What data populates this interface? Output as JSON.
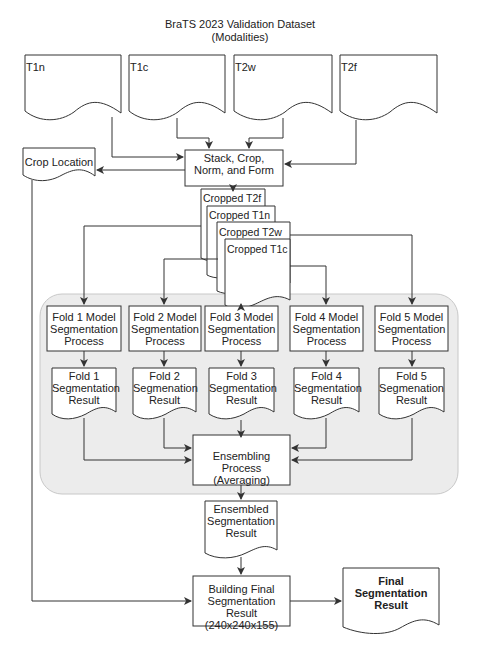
{
  "title": {
    "line1": "BraTS 2023 Validation Dataset",
    "line2": "(Modalities)"
  },
  "modalities": [
    {
      "label": "T1n"
    },
    {
      "label": "T1c"
    },
    {
      "label": "T2w"
    },
    {
      "label": "T2f"
    }
  ],
  "preprocess": {
    "line1": "Stack, Crop,",
    "line2": "Norm, and Form"
  },
  "crop_location": {
    "label": "Crop Location"
  },
  "cropped": [
    {
      "label": "Cropped T2f"
    },
    {
      "label": "Cropped T1n"
    },
    {
      "label": "Cropped T2w"
    },
    {
      "label": "Cropped T1c"
    }
  ],
  "folds": [
    {
      "process": [
        "Fold 1 Model",
        "Segmentation",
        "Process"
      ],
      "result": [
        "Fold 1",
        "Segmentation",
        "Result"
      ]
    },
    {
      "process": [
        "Fold 2 Model",
        "Segmentation",
        "Process"
      ],
      "result": [
        "Fold 2",
        "Segmenation",
        "Result"
      ]
    },
    {
      "process": [
        "Fold 3 Model",
        "Segmentation",
        "Process"
      ],
      "result": [
        "Fold 3",
        "Segmentation",
        "Result"
      ]
    },
    {
      "process": [
        "Fold 4 Model",
        "Segmentation",
        "Process"
      ],
      "result": [
        "Fold 4",
        "Segmentation",
        "Result"
      ]
    },
    {
      "process": [
        "Fold 5 Model",
        "Segmentation",
        "Process"
      ],
      "result": [
        "Fold 5",
        "Segmenation",
        "Result"
      ]
    }
  ],
  "ensembling": {
    "line1": "Ensembling Process",
    "line2": "(Averaging)"
  },
  "ensembled_result": {
    "line1": "Ensembled",
    "line2": "Segmentation",
    "line3": "Result"
  },
  "building_final": {
    "line1": "Building Final",
    "line2": "Segmentation Result",
    "line3": "(240x240x155)"
  },
  "final_result": {
    "line1": "Final",
    "line2": "Segmentation",
    "line3": "Result"
  },
  "colors": {
    "stroke": "#333333",
    "group_fill": "#ececec",
    "group_stroke": "#c8c8c8",
    "box_fill": "#ffffff"
  }
}
